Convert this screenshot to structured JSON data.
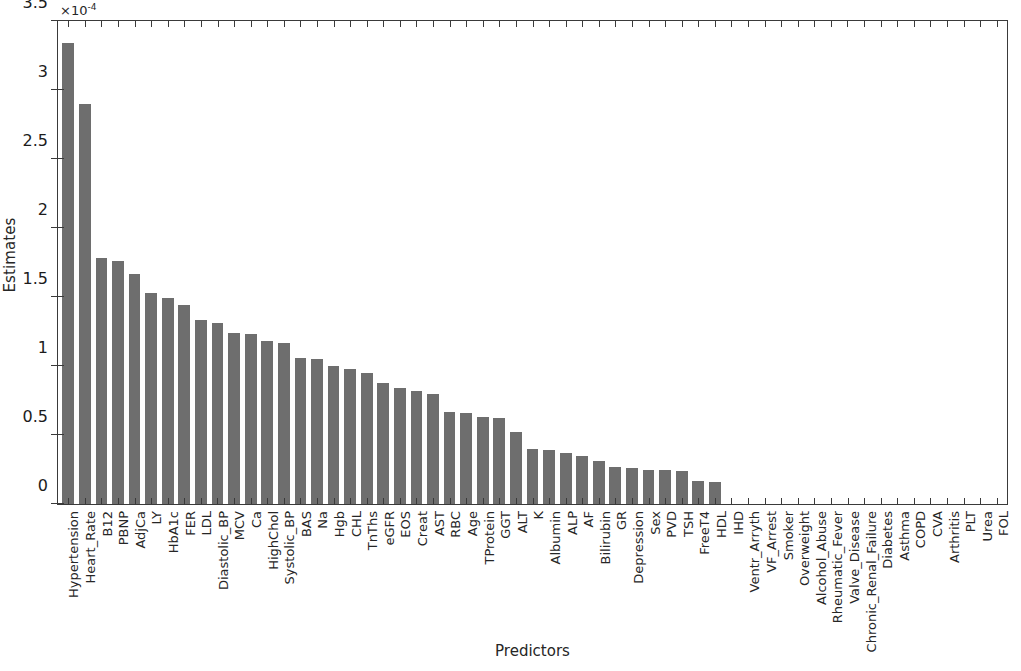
{
  "chart_data": {
    "type": "bar",
    "title": "",
    "xlabel": "Predictors",
    "ylabel": "Estimates",
    "y_exponent_label": "×10",
    "y_exponent_power": "-4",
    "y_scale_factor": 0.0001,
    "ylim": [
      0,
      3.5
    ],
    "y_tick_labels": [
      "0",
      "0.5",
      "1",
      "1.5",
      "2",
      "2.5",
      "3",
      "3.5"
    ],
    "y_tick_values": [
      0,
      0.5,
      1,
      1.5,
      2,
      2.5,
      3,
      3.5
    ],
    "grid": false,
    "legend": null,
    "bar_color": "#6e6e6e",
    "axis_color": "#3a3a3a",
    "background_color": "#ffffff",
    "categories": [
      "Hypertension",
      "Heart_Rate",
      "B12",
      "PBNP",
      "AdjCa",
      "LY",
      "HbA1c",
      "FER",
      "LDL",
      "Diastolic_BP",
      "MCV",
      "Ca",
      "HighChol",
      "Systolic_BP",
      "BAS",
      "Na",
      "Hgb",
      "CHL",
      "TnThs",
      "eGFR",
      "EOS",
      "Creat",
      "AST",
      "RBC",
      "Age",
      "TProtein",
      "GGT",
      "ALT",
      "K",
      "Albumin",
      "ALP",
      "AF",
      "Bilirubin",
      "GR",
      "Depression",
      "Sex",
      "PVD",
      "TSH",
      "FreeT4",
      "HDL",
      "IHD",
      "Ventr_Arryth",
      "VF_Arrest",
      "Smoker",
      "Overweight",
      "Alcohol_Abuse",
      "Rheumatic_Fever",
      "Valve_Disease",
      "Chronic_Renal_Failure",
      "Diabetes",
      "Asthma",
      "COPD",
      "CVA",
      "Arthritis",
      "PLT",
      "Urea",
      "FOL"
    ],
    "values": [
      3.34,
      2.9,
      1.78,
      1.76,
      1.67,
      1.53,
      1.49,
      1.44,
      1.33,
      1.31,
      1.24,
      1.23,
      1.18,
      1.17,
      1.06,
      1.05,
      1.0,
      0.98,
      0.95,
      0.88,
      0.84,
      0.82,
      0.8,
      0.67,
      0.66,
      0.63,
      0.62,
      0.52,
      0.4,
      0.39,
      0.37,
      0.35,
      0.31,
      0.27,
      0.26,
      0.25,
      0.25,
      0.24,
      0.17,
      0.16,
      0,
      0,
      0,
      0,
      0,
      0,
      0,
      0,
      0,
      0,
      0,
      0,
      0,
      0,
      0,
      0,
      0
    ]
  },
  "axes": {
    "ylabel_text": "Estimates",
    "xlabel_text": "Predictors"
  }
}
